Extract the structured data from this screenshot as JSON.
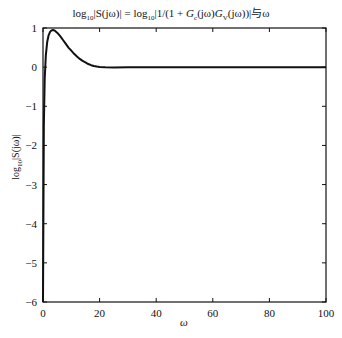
{
  "chart_data": {
    "type": "line",
    "title": "log10|S(jω)| = log10|1/(1 + Gc(jω)GV(jω))|与ω",
    "title_parts": {
      "lhs_log": "log",
      "lhs_sub": "10",
      "lhs_rest": "|S(jω)| = ",
      "rhs_log": "log",
      "rhs_sub": "10",
      "rhs_a": "|1/(1 + ",
      "G1": "G",
      "G1_sub": "c",
      "mid": "(jω)",
      "G2": "G",
      "G2_sub": "V",
      "rhs_b": "(jω))|",
      "suffix": "与ω"
    },
    "xlabel": "ω",
    "ylabel": "log10|S(jω)|",
    "ylabel_parts": {
      "log": "log",
      "sub": "10",
      "rest": "|S(jω)|"
    },
    "xlim": [
      0,
      100
    ],
    "ylim": [
      -6,
      1
    ],
    "xticks": [
      0,
      20,
      40,
      60,
      80,
      100
    ],
    "yticks": [
      1,
      0,
      -1,
      -2,
      -3,
      -4,
      -5,
      -6
    ],
    "grid": false,
    "legend": null,
    "series": [
      {
        "name": "log10|S(jω)|",
        "color": "#111111",
        "x": [
          0,
          0.3,
          0.6,
          1.0,
          1.5,
          2.0,
          2.5,
          3.0,
          3.5,
          4.0,
          5.0,
          6.0,
          7.0,
          8.0,
          9.0,
          10.0,
          11.0,
          12.0,
          13.0,
          14.0,
          15.0,
          16.0,
          17.0,
          18.0,
          19.0,
          20.0,
          22.0,
          25.0,
          30.0,
          40.0,
          60.0,
          80.0,
          100.0
        ],
        "y": [
          -6.0,
          -1.5,
          -0.3,
          0.3,
          0.65,
          0.82,
          0.9,
          0.94,
          0.95,
          0.94,
          0.88,
          0.8,
          0.7,
          0.6,
          0.5,
          0.42,
          0.34,
          0.27,
          0.21,
          0.16,
          0.12,
          0.08,
          0.05,
          0.03,
          0.015,
          0.005,
          -0.005,
          -0.01,
          -0.005,
          0.0,
          0.0,
          0.0,
          0.0
        ]
      }
    ]
  }
}
